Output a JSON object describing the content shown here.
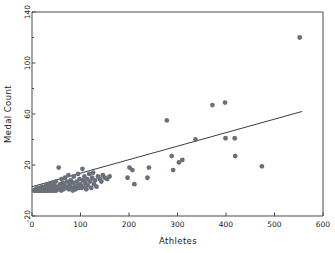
{
  "chart_data": {
    "type": "scatter",
    "title": "",
    "xlabel": "Athletes",
    "ylabel": "Medal Count",
    "xlim": [
      0,
      600
    ],
    "ylim": [
      -20,
      140
    ],
    "xticks": [
      0,
      100,
      200,
      300,
      400,
      500,
      600
    ],
    "xtick_labels": [
      "0",
      "100",
      "200",
      "300",
      "400",
      "500",
      "600"
    ],
    "yticks": [
      -20,
      20,
      60,
      100,
      140
    ],
    "ytick_labels": [
      "-20",
      "20",
      "60",
      "100",
      "140"
    ],
    "yticks_minor": [
      0,
      40,
      80,
      120
    ],
    "grid": false,
    "legend": null,
    "point_color": "#6a7079",
    "line_color": "#3c3c44",
    "frame_color": "#4a4a4a",
    "series": [
      {
        "name": "Countries",
        "points": [
          [
            4,
            0
          ],
          [
            6,
            0
          ],
          [
            7,
            0
          ],
          [
            8,
            1
          ],
          [
            9,
            0
          ],
          [
            10,
            0
          ],
          [
            11,
            2
          ],
          [
            12,
            0
          ],
          [
            13,
            1
          ],
          [
            14,
            0
          ],
          [
            15,
            0
          ],
          [
            16,
            2
          ],
          [
            17,
            0
          ],
          [
            18,
            1
          ],
          [
            19,
            0
          ],
          [
            20,
            0
          ],
          [
            21,
            3
          ],
          [
            22,
            0
          ],
          [
            23,
            1
          ],
          [
            24,
            0
          ],
          [
            25,
            2
          ],
          [
            26,
            0
          ],
          [
            27,
            1
          ],
          [
            28,
            0
          ],
          [
            29,
            4
          ],
          [
            30,
            0
          ],
          [
            31,
            1
          ],
          [
            32,
            2
          ],
          [
            33,
            0
          ],
          [
            34,
            1
          ],
          [
            35,
            5
          ],
          [
            36,
            0
          ],
          [
            37,
            2
          ],
          [
            38,
            1
          ],
          [
            39,
            0
          ],
          [
            40,
            3
          ],
          [
            41,
            0
          ],
          [
            42,
            6
          ],
          [
            43,
            1
          ],
          [
            44,
            0
          ],
          [
            45,
            2
          ],
          [
            46,
            4
          ],
          [
            47,
            0
          ],
          [
            48,
            1
          ],
          [
            49,
            7
          ],
          [
            50,
            0
          ],
          [
            52,
            3
          ],
          [
            54,
            2
          ],
          [
            55,
            18
          ],
          [
            56,
            1
          ],
          [
            58,
            5
          ],
          [
            60,
            0
          ],
          [
            61,
            9
          ],
          [
            62,
            2
          ],
          [
            64,
            6
          ],
          [
            65,
            1
          ],
          [
            67,
            4
          ],
          [
            68,
            10
          ],
          [
            70,
            2
          ],
          [
            72,
            7
          ],
          [
            74,
            3
          ],
          [
            75,
            12
          ],
          [
            76,
            1
          ],
          [
            78,
            5
          ],
          [
            80,
            8
          ],
          [
            82,
            2
          ],
          [
            84,
            0
          ],
          [
            85,
            6
          ],
          [
            86,
            11
          ],
          [
            88,
            3
          ],
          [
            90,
            1
          ],
          [
            92,
            7
          ],
          [
            94,
            4
          ],
          [
            95,
            13
          ],
          [
            96,
            2
          ],
          [
            98,
            9
          ],
          [
            100,
            5
          ],
          [
            102,
            2
          ],
          [
            104,
            17
          ],
          [
            105,
            8
          ],
          [
            106,
            3
          ],
          [
            108,
            11
          ],
          [
            110,
            6
          ],
          [
            112,
            1
          ],
          [
            114,
            9
          ],
          [
            115,
            4
          ],
          [
            118,
            13
          ],
          [
            120,
            7
          ],
          [
            122,
            2
          ],
          [
            124,
            10
          ],
          [
            126,
            14
          ],
          [
            128,
            5
          ],
          [
            130,
            8
          ],
          [
            133,
            3
          ],
          [
            136,
            11
          ],
          [
            140,
            9
          ],
          [
            143,
            7
          ],
          [
            146,
            12
          ],
          [
            150,
            10
          ],
          [
            155,
            9
          ],
          [
            160,
            11
          ],
          [
            197,
            10
          ],
          [
            201,
            18
          ],
          [
            207,
            16
          ],
          [
            211,
            5
          ],
          [
            238,
            10
          ],
          [
            241,
            18
          ],
          [
            278,
            55
          ],
          [
            288,
            27
          ],
          [
            291,
            16
          ],
          [
            303,
            22
          ],
          [
            310,
            24
          ],
          [
            337,
            40
          ],
          [
            372,
            67
          ],
          [
            398,
            69
          ],
          [
            399,
            41
          ],
          [
            418,
            41
          ],
          [
            419,
            27
          ],
          [
            474,
            19
          ],
          [
            552,
            120
          ]
        ]
      }
    ],
    "trendline": {
      "name": "linear-fit",
      "x0": 0,
      "y0": 3,
      "x1": 557,
      "y1": 62
    }
  }
}
